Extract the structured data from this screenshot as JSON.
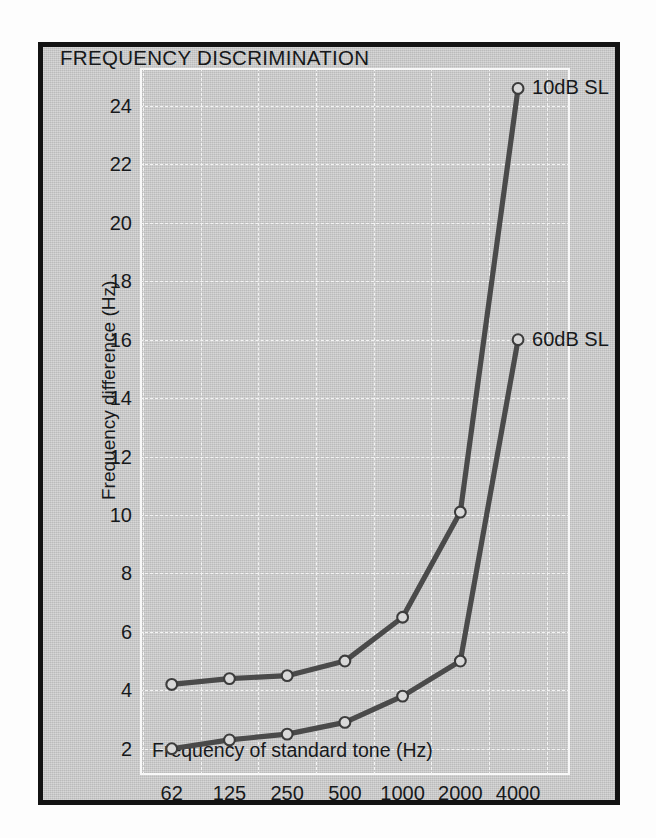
{
  "figure": {
    "title": "FREQUENCY DISCRIMINATION",
    "background_color": "#c8c8c8",
    "frame_color": "#131313",
    "gridline_color": "#f4f4f4",
    "line_color": "#4a4a4a",
    "marker_fill": "#d8d8d8"
  },
  "chart_data": {
    "type": "line",
    "title": "FREQUENCY DISCRIMINATION",
    "xlabel": "Frequency of standard tone (Hz)",
    "ylabel": "Frequency difference (Hz)",
    "x_scale": "log2-categorical",
    "categories": [
      "62",
      "125",
      "250",
      "500",
      "1000",
      "2000",
      "4000"
    ],
    "x_tick_labels": [
      "62",
      "125",
      "250",
      "500",
      "1000",
      "2000",
      "4000"
    ],
    "y_tick_labels": [
      "2",
      "4",
      "6",
      "8",
      "10",
      "12",
      "14",
      "16",
      "18",
      "20",
      "22",
      "24"
    ],
    "y_ticks": [
      2,
      4,
      6,
      8,
      10,
      12,
      14,
      16,
      18,
      20,
      22,
      24
    ],
    "ylim": [
      1.1,
      25.3
    ],
    "grid": true,
    "grid_style": "dashed-white",
    "legend_position": "inline-right-of-endpoint",
    "marker": "open-circle",
    "series": [
      {
        "name": "10dB SL",
        "annotation": "10dB SL",
        "values": [
          4.2,
          4.4,
          4.5,
          5.0,
          6.5,
          10.1,
          24.6
        ]
      },
      {
        "name": "60dB SL",
        "annotation": "60dB SL",
        "values": [
          2.0,
          2.3,
          2.5,
          2.9,
          3.8,
          5.0,
          16.0
        ]
      }
    ]
  }
}
